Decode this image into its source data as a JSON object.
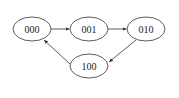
{
  "diagram": {
    "type": "state-transition",
    "nodes": [
      {
        "id": "n000",
        "label": "000",
        "cx": 32,
        "cy": 29
      },
      {
        "id": "n001",
        "label": "001",
        "cx": 89,
        "cy": 29
      },
      {
        "id": "n010",
        "label": "010",
        "cx": 146,
        "cy": 29
      },
      {
        "id": "n100",
        "label": "100",
        "cx": 89,
        "cy": 66
      }
    ],
    "edges": [
      {
        "from": "000",
        "to": "001"
      },
      {
        "from": "001",
        "to": "010"
      },
      {
        "from": "010",
        "to": "100"
      },
      {
        "from": "100",
        "to": "000"
      }
    ],
    "colors": {
      "stroke": "#333333",
      "background": "#ffffff"
    }
  }
}
